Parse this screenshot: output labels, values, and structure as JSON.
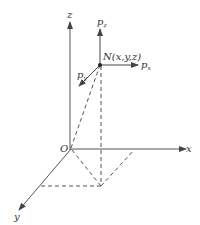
{
  "diagram": {
    "type": "3d-coordinate-momentum-diagram",
    "labels": {
      "origin": "O",
      "x_axis": "x",
      "y_axis": "y",
      "z_axis": "z",
      "point": "N(x,y,z)",
      "p_x": "p",
      "p_x_sub": "x",
      "p_y": "p",
      "p_y_sub": "y",
      "p_z": "p",
      "p_z_sub": "z"
    },
    "colors": {
      "line": "#555555",
      "text": "#333333"
    }
  }
}
